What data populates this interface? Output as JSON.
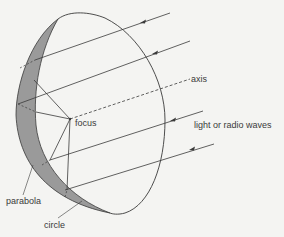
{
  "diagram": {
    "type": "parabolic-reflector",
    "labels": {
      "axis": "axis",
      "focus": "focus",
      "waves": "light or radio waves",
      "parabola": "parabola",
      "circle": "circle"
    },
    "colors": {
      "background": "#f4f4f2",
      "line": "#3a3a3a",
      "shaded_rim": "#9a9a9a"
    }
  }
}
